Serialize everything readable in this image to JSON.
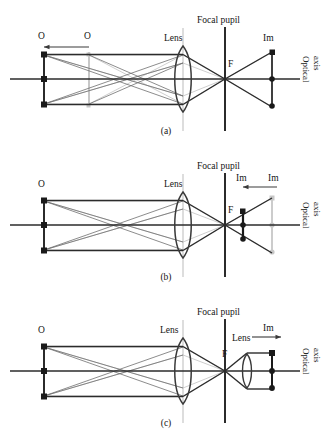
{
  "figure": {
    "width": 332,
    "height": 438,
    "background": "#ffffff",
    "colors": {
      "ray_dark": "#2b2b2b",
      "ray_mid": "#6f6f6f",
      "ray_light": "#b9b9b9",
      "ghost": "#c7c7c7",
      "lens_stroke": "#3a3a3a",
      "pupil_line": "#2b2b2b",
      "lens_guide": "#cfcfcf",
      "axis": "#2b2b2b",
      "text": "#141414"
    }
  },
  "panels": [
    {
      "id": "a",
      "caption": "(a)",
      "labels": {
        "object_near": "O",
        "object_far": "O",
        "lens": "Lens",
        "focal_pupil": "Focal pupil",
        "focus": "F",
        "image": "Im",
        "optical_axis": "Optical\naxis"
      },
      "description": "Object plane displaced along the axis (arrow from O to O); image forms beyond the focal pupil.",
      "shift_arrow_direction": "right"
    },
    {
      "id": "b",
      "caption": "(b)",
      "labels": {
        "object": "O",
        "lens": "Lens",
        "focal_pupil": "Focal pupil",
        "focus": "F",
        "image_new": "Im",
        "image_old": "Im",
        "optical_axis": "Optical\naxis"
      },
      "description": "Image plane shifts toward the focal pupil (arrow pointing left); original image position shown in grey.",
      "shift_arrow_direction": "left"
    },
    {
      "id": "c",
      "caption": "(c)",
      "labels": {
        "object": "O",
        "lens_primary": "Lens",
        "focal_pupil": "Focal pupil",
        "focus": "F",
        "lens_secondary": "Lens",
        "image": "Im",
        "optical_axis": "Optical\naxis"
      },
      "description": "A second lens placed after the focal pupil collimates the beam; image formed at the right (arrow pointing right).",
      "shift_arrow_direction": "right"
    }
  ],
  "optical_axis_text": {
    "line1": "Optical",
    "line2": "axis"
  }
}
